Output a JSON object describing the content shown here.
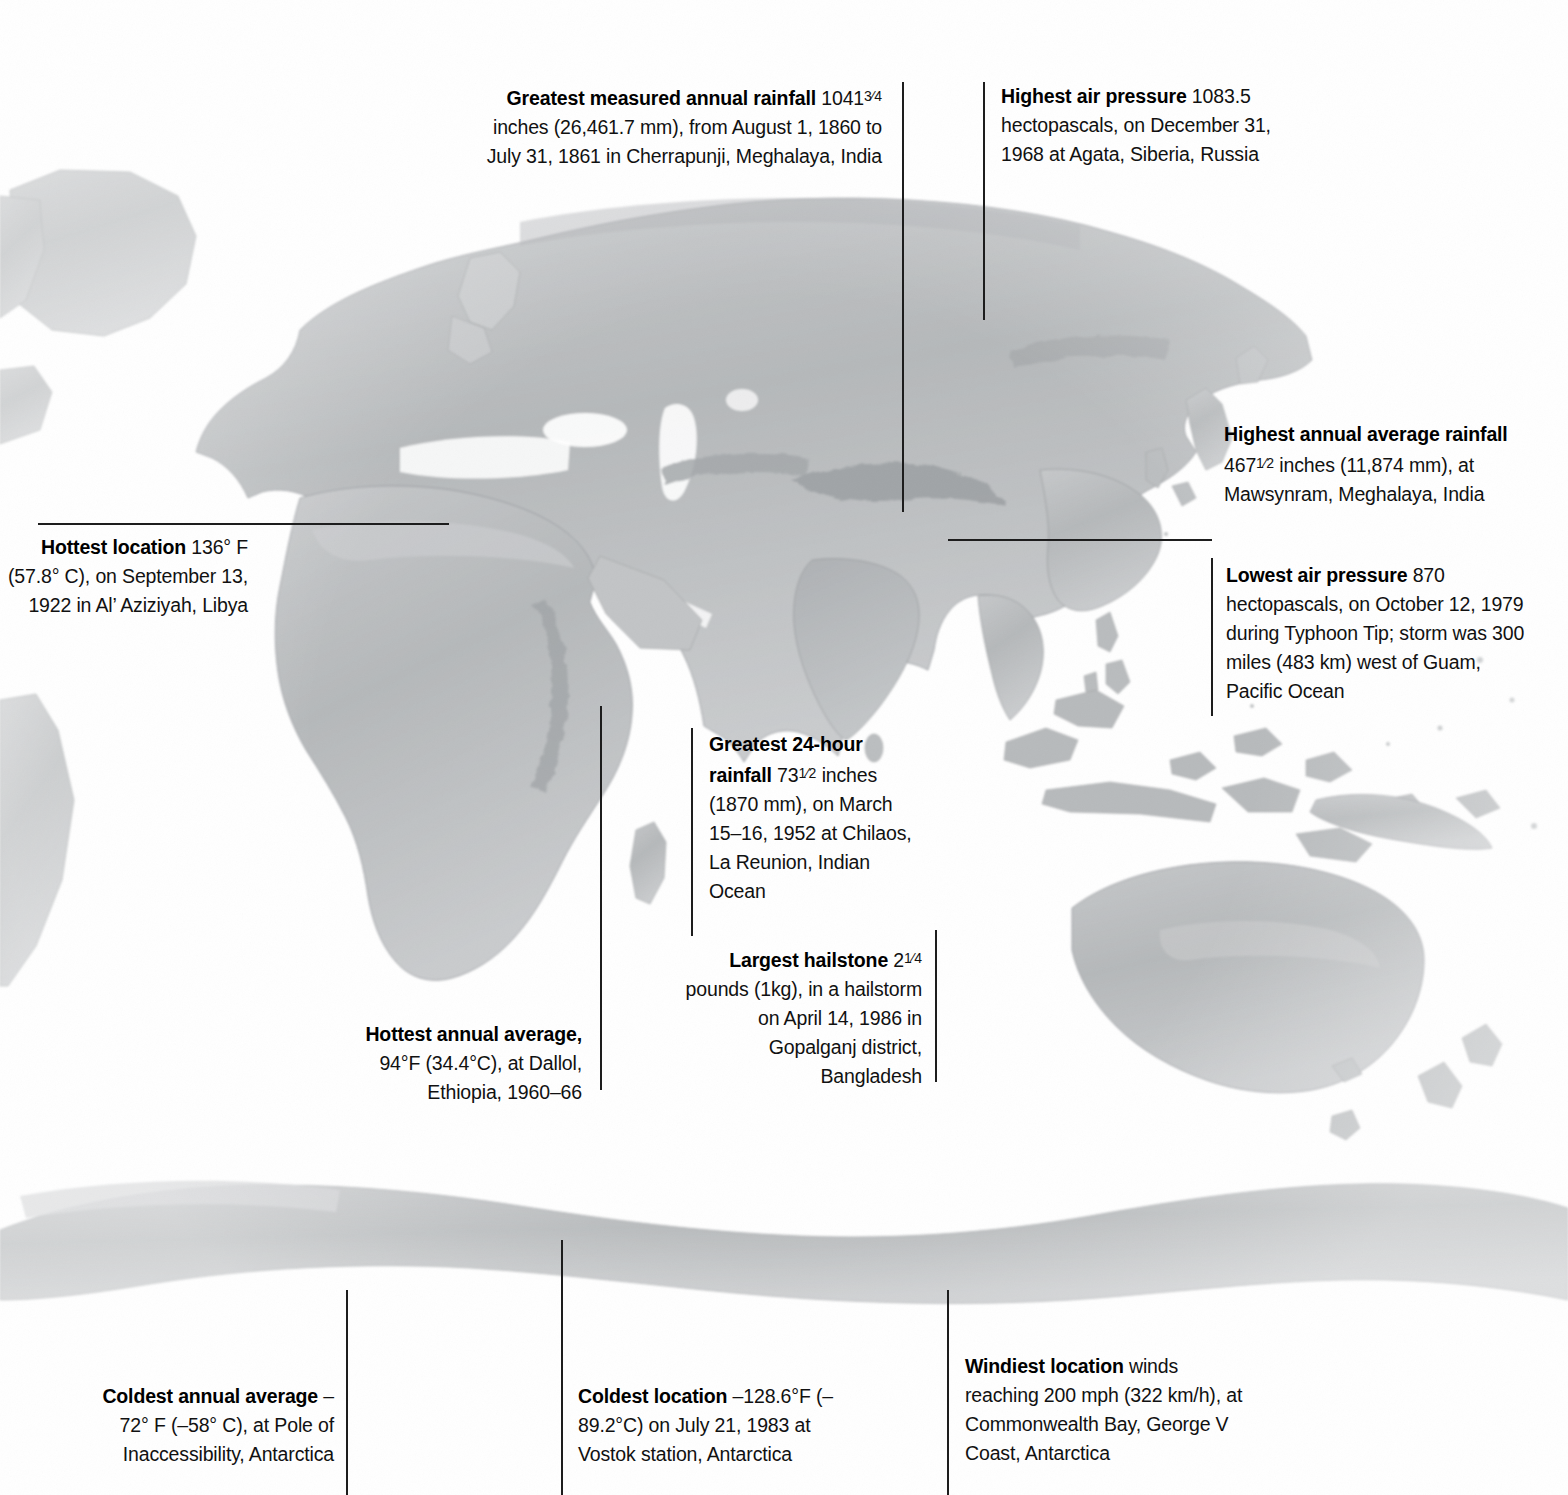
{
  "page": {
    "width": 1568,
    "height": 1495,
    "background": "#ffffff",
    "line_color": "#1d1d1d",
    "text_color": "#111111",
    "land_fill": "#b9bbbd",
    "land_edge": "#8d9093"
  },
  "map": {
    "type": "shaded-relief-world-map",
    "projection": "equirectangular",
    "hemisphere_focus": "eastern",
    "regions_visible": [
      "Greenland",
      "North America (eastern edge)",
      "South America (eastern edge)",
      "Europe",
      "Africa",
      "Asia",
      "Indian subcontinent",
      "Southeast Asia",
      "Japan",
      "Indonesia",
      "Australia",
      "New Zealand",
      "Antarctica"
    ]
  },
  "callouts": [
    {
      "id": "greatest-measured-annual-rainfall",
      "name": "callout-greatest-measured-annual-rainfall",
      "title": "Greatest measured annual rainfall",
      "title_lead": "Greatest measured annual",
      "title_tail": "rainfall",
      "body": " 1041¾ inches (26,461.7 mm), from August 1, 1860 to July 31, 1861 in Cherrapunji, Meghalaya, India",
      "value": "1041¾ inches (26,461.7 mm)",
      "value_metric": "26,461.7 mm",
      "date": "August 1, 1860 to July 31, 1861",
      "location": "Cherrapunji, Meghalaya, India",
      "align": "right",
      "x": 480,
      "y": 82,
      "width": 402,
      "line": {
        "orientation": "vertical",
        "x": 902,
        "y1": 82,
        "y2": 512
      }
    },
    {
      "id": "highest-air-pressure",
      "name": "callout-highest-air-pressure",
      "title": "Highest air pressure",
      "title_lead": "Highest air pressure",
      "title_tail": "",
      "body": "1083.5 hectopascals, on December 31, 1968 at Agata, Siberia, Russia",
      "value": "1083.5 hectopascals",
      "date": "December 31, 1968",
      "location": "Agata, Siberia, Russia",
      "align": "left",
      "x": 1001,
      "y": 82,
      "width": 300,
      "line": {
        "orientation": "vertical",
        "x": 983,
        "y1": 82,
        "y2": 320
      }
    },
    {
      "id": "highest-annual-average-rainfall",
      "name": "callout-highest-annual-average-rainfall",
      "title": "Highest annual average rainfall",
      "title_lead": "Highest annual average",
      "title_tail": "rainfall",
      "body": " 467½ inches (11,874 mm), at Mawsynram, Meghalaya, India",
      "value": "467½ inches (11,874 mm)",
      "value_metric": "11,874 mm",
      "date": "",
      "location": "Mawsynram, Meghalaya, India",
      "align": "left",
      "x": 1224,
      "y": 420,
      "width": 300,
      "line": {
        "orientation": "horizontal",
        "x1": 948,
        "x2": 1212,
        "y": 539
      }
    },
    {
      "id": "hottest-location",
      "name": "callout-hottest-location",
      "title": "Hottest location",
      "title_lead": "Hottest location",
      "title_tail": "",
      "body": "136° F (57.8° C), on September 13, 1922 in Al’ Aziziyah, Libya",
      "value": "136° F (57.8° C)",
      "date": "September 13, 1922",
      "location": "Al’ Aziziyah, Libya",
      "align": "right",
      "x": 0,
      "y": 533,
      "width": 248,
      "line": {
        "orientation": "horizontal",
        "x1": 38,
        "x2": 449,
        "y": 523
      }
    },
    {
      "id": "lowest-air-pressure",
      "name": "callout-lowest-air-pressure",
      "title": "Lowest air pressure",
      "title_lead": "Lowest air pressure",
      "title_tail": "",
      "body": "870 hectopascals, on October 12, 1979 during Typhoon Tip; storm was 300 miles (483 km) west of Guam, Pacific Ocean",
      "value": "870 hectopascals",
      "date": "October 12, 1979",
      "event": "Typhoon Tip",
      "location": "300 miles (483 km) west of Guam, Pacific Ocean",
      "align": "left",
      "x": 1226,
      "y": 561,
      "width": 300,
      "line": {
        "orientation": "vertical",
        "x": 1211,
        "y1": 558,
        "y2": 716
      }
    },
    {
      "id": "greatest-24-hour-rainfall",
      "name": "callout-greatest-24-hour-rainfall",
      "title": "Greatest 24-hour rainfall",
      "title_lead": "Greatest 24-hour",
      "title_tail": "rainfall",
      "body": " 73½ inches (1870 mm), on March 15–16, 1952 at Chilaos, La Reunion, Indian Ocean",
      "value": "73½ inches (1870 mm)",
      "value_metric": "1870 mm",
      "date": "March 15–16, 1952",
      "location": "Chilaos, La Reunion, Indian Ocean",
      "align": "left",
      "x": 709,
      "y": 730,
      "width": 212,
      "line": {
        "orientation": "vertical",
        "x": 691,
        "y1": 728,
        "y2": 936
      }
    },
    {
      "id": "largest-hailstone",
      "name": "callout-largest-hailstone",
      "title": "Largest hailstone",
      "title_lead": "Largest hailstone",
      "title_tail": "",
      "body": "2¼ pounds (1kg), in a hailstorm on April 14, 1986 in Gopalganj district, Bangladesh",
      "value": "2¼ pounds (1kg)",
      "date": "April 14, 1986",
      "location": "Gopalganj district, Bangladesh",
      "align": "right",
      "x": 672,
      "y": 944,
      "width": 250,
      "line": {
        "orientation": "vertical",
        "x": 935,
        "y1": 930,
        "y2": 1082
      }
    },
    {
      "id": "hottest-annual-average",
      "name": "callout-hottest-annual-average",
      "title": "Hottest annual average,",
      "title_lead": "Hottest annual",
      "title_tail": "average,",
      "body": " 94°F (34.4°C), at Dallol, Ethiopia, 1960–66",
      "value": "94°F (34.4°C)",
      "date": "1960–66",
      "location": "Dallol, Ethiopia",
      "align": "right",
      "x": 332,
      "y": 1020,
      "width": 250,
      "line": {
        "orientation": "vertical",
        "x": 600,
        "y1": 706,
        "y2": 1090
      }
    },
    {
      "id": "coldest-annual-average",
      "name": "callout-coldest-annual-average",
      "title": "Coldest annual average",
      "title_lead": "Coldest annual average",
      "title_tail": "",
      "body": "–72° F (–58° C), at Pole of Inaccessibility, Antarctica",
      "value": "–72° F (–58° C)",
      "date": "",
      "location": "Pole of Inaccessibility, Antarctica",
      "align": "right",
      "x": 82,
      "y": 1382,
      "width": 252,
      "line": {
        "orientation": "vertical",
        "x": 346,
        "y1": 1290,
        "y2": 1495
      }
    },
    {
      "id": "coldest-location",
      "name": "callout-coldest-location",
      "title": "Coldest location",
      "title_lead": "Coldest location",
      "title_tail": "",
      "body": " –128.6°F (–89.2°C) on July 21, 1983 at Vostok station, Antarctica",
      "value": "–128.6°F (–89.2°C)",
      "date": "July 21, 1983",
      "location": "Vostok station, Antarctica",
      "align": "left",
      "x": 578,
      "y": 1382,
      "width": 262,
      "line": {
        "orientation": "vertical",
        "x": 561,
        "y1": 1240,
        "y2": 1495
      }
    },
    {
      "id": "windiest-location",
      "name": "callout-windiest-location",
      "title": "Windiest location",
      "title_lead": "Windiest location",
      "title_tail": "",
      "body": " winds reaching 200 mph (322 km/h), at Commonwealth Bay, George V Coast, Antarctica",
      "value": "200 mph (322 km/h)",
      "date": "",
      "location": "Commonwealth Bay, George V Coast, Antarctica",
      "align": "left",
      "x": 965,
      "y": 1352,
      "width": 280,
      "line": {
        "orientation": "vertical",
        "x": 947,
        "y1": 1290,
        "y2": 1495
      }
    }
  ]
}
